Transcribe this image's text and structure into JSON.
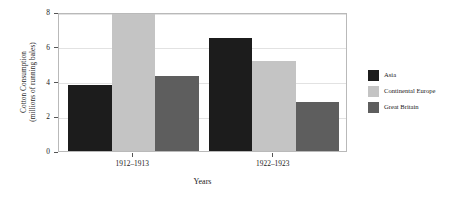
{
  "chart_data": {
    "type": "bar",
    "title": "",
    "xlabel": "Years",
    "ylabel": "Cotton Consumption (millions of running bales)",
    "ylabel_line1": "Cotton Consumption",
    "ylabel_line2": "(millions of running bales)",
    "categories": [
      "1912–1913",
      "1922–1923"
    ],
    "series": [
      {
        "name": "Asia",
        "color": "#1c1c1c",
        "values": [
          3.8,
          6.5
        ]
      },
      {
        "name": "Continental Europe",
        "color": "#c4c4c4",
        "values": [
          7.9,
          5.2
        ]
      },
      {
        "name": "Great Britain",
        "color": "#5e5e5e",
        "values": [
          4.3,
          2.8
        ]
      }
    ],
    "ylim": [
      0,
      8
    ],
    "yticks": [
      "0",
      "2",
      "4",
      "6",
      "8"
    ],
    "ytick_values": [
      0,
      2,
      4,
      6,
      8
    ],
    "grid": true,
    "legend_position": "right"
  },
  "legend": {
    "entries": [
      {
        "label": "Asia",
        "color": "#1c1c1c"
      },
      {
        "label": "Continental Europe",
        "color": "#c4c4c4"
      },
      {
        "label": "Great Britain",
        "color": "#5e5e5e"
      }
    ]
  },
  "colors": {
    "asia": "#1c1c1c",
    "continental_europe": "#c4c4c4",
    "great_britain": "#5e5e5e",
    "frame": "#b9b9b9",
    "grid": "#e2e2e2",
    "text": "#1a1a1a",
    "background": "#ffffff"
  }
}
